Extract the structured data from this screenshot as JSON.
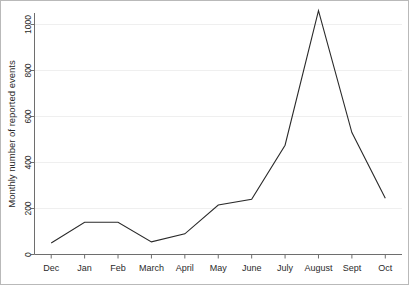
{
  "chart_data": {
    "type": "line",
    "title": "",
    "xlabel": "",
    "ylabel": "Monthly number of reported events",
    "categories": [
      "Dec",
      "Jan",
      "Feb",
      "March",
      "April",
      "May",
      "June",
      "July",
      "August",
      "Sept",
      "Oct"
    ],
    "values": [
      50,
      140,
      140,
      55,
      90,
      215,
      240,
      475,
      1060,
      530,
      245
    ],
    "series": [
      {
        "name": "Monthly reported events",
        "values": [
          50,
          140,
          140,
          55,
          90,
          215,
          240,
          475,
          1060,
          530,
          245
        ]
      }
    ],
    "ylim": [
      0,
      1100
    ],
    "yticks": [
      0,
      200,
      400,
      600,
      800,
      1000
    ],
    "ytick_labels": [
      "0",
      "200",
      "400",
      "600",
      "800",
      "1000"
    ],
    "grid": "horizontal",
    "legend": "none",
    "line_color": "#2a2a2a",
    "grid_color": "#efefef",
    "axis_color": "#6e6e6e",
    "background_color": "#ffffff"
  },
  "axis": {
    "y_title": "Monthly number of reported events"
  }
}
